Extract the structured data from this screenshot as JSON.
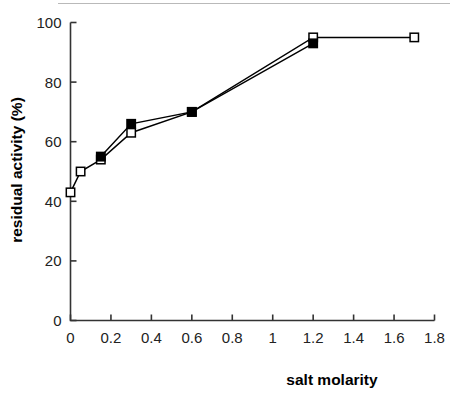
{
  "figure": {
    "background_color": "#ffffff",
    "top_rule_color": "#b9b9b9",
    "axis_color": "#333333",
    "series_line_color": "#000000",
    "open_marker_fill": "#ffffff",
    "filled_marker_fill": "#000000"
  },
  "chart_data": {
    "type": "line",
    "title": "",
    "subtitle": "",
    "xlabel": "salt molarity",
    "ylabel": "residual activity (%)",
    "xlim": [
      0,
      1.8
    ],
    "ylim": [
      0,
      100
    ],
    "xticks": [
      0,
      0.2,
      0.4,
      0.6,
      0.8,
      1,
      1.2,
      1.4,
      1.6,
      1.8
    ],
    "xtick_labels": [
      "0",
      "0.2",
      "0.4",
      "0.6",
      "0.8",
      "1",
      "1.2",
      "1.4",
      "1.6",
      "1.8"
    ],
    "yticks": [
      0,
      20,
      40,
      60,
      80,
      100
    ],
    "ytick_labels": [
      "0",
      "20",
      "40",
      "60",
      "80",
      "100"
    ],
    "grid": false,
    "legend": "none",
    "tick_direction": "in",
    "series": [
      {
        "name": "open-square-series",
        "marker": "open-square",
        "x": [
          0,
          0.05,
          0.15,
          0.3,
          0.6,
          1.2,
          1.7
        ],
        "y": [
          43,
          50,
          54,
          63,
          70,
          95,
          95
        ]
      },
      {
        "name": "filled-square-series",
        "marker": "filled-square",
        "x": [
          0.15,
          0.3,
          0.6,
          1.2
        ],
        "y": [
          55,
          66,
          70,
          93
        ]
      }
    ]
  }
}
